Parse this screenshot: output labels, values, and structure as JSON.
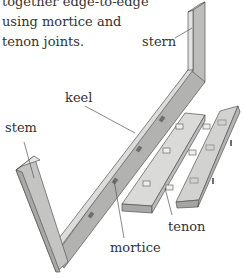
{
  "caption": {
    "lines": [
      "together edge-to-edge",
      "using mortice and",
      "tenon joints."
    ]
  },
  "labels": {
    "stern": "stern",
    "keel": "keel",
    "stem": "stem",
    "tenon": "tenon",
    "mortice": "mortice"
  },
  "colors": {
    "wood_light": "#d6d6d4",
    "wood_mid": "#bdbdbb",
    "wood_dark": "#9c9c9a",
    "outline": "#555555",
    "text": "#333333"
  }
}
